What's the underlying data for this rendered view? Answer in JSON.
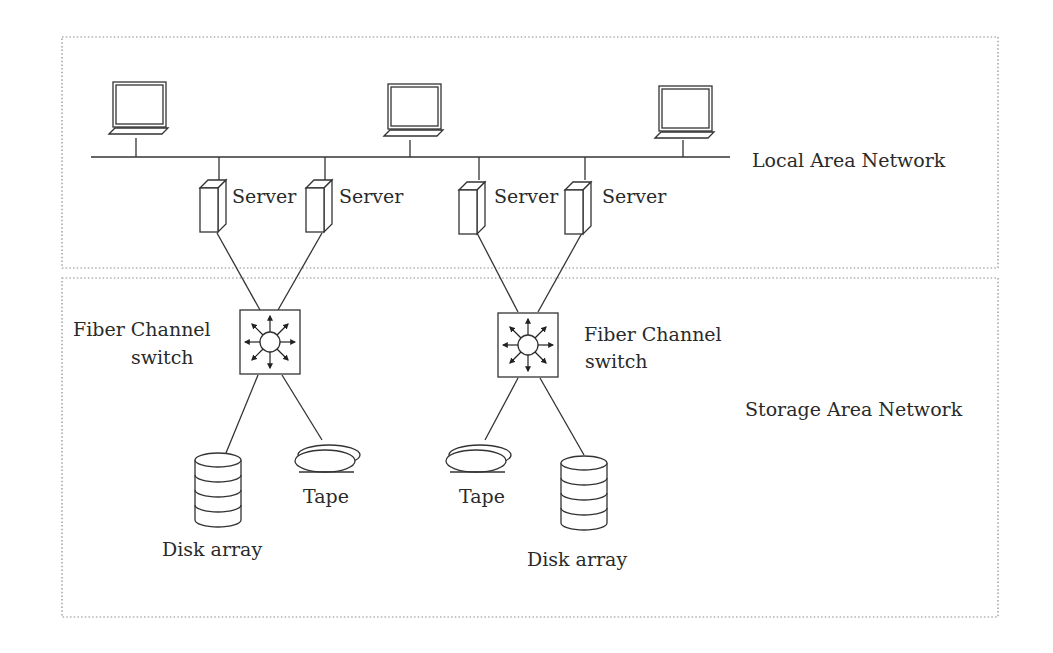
{
  "diagram": {
    "type": "network-architecture",
    "colors": {
      "line": "#333333",
      "border": "#8a8a8a",
      "background": "#ffffff",
      "text": "#2a2a2a"
    },
    "regions": {
      "lan": {
        "label": "Local Area Network"
      },
      "san": {
        "label": "Storage Area Network"
      }
    },
    "nodes": {
      "laptops": [
        {
          "id": "laptop-1"
        },
        {
          "id": "laptop-2"
        },
        {
          "id": "laptop-3"
        }
      ],
      "servers": [
        {
          "id": "server-1",
          "label": "Server"
        },
        {
          "id": "server-2",
          "label": "Server"
        },
        {
          "id": "server-3",
          "label": "Server"
        },
        {
          "id": "server-4",
          "label": "Server"
        }
      ],
      "switches": [
        {
          "id": "switch-1",
          "label_line1": "Fiber Channel",
          "label_line2": "switch"
        },
        {
          "id": "switch-2",
          "label_line1": "Fiber Channel",
          "label_line2": "switch"
        }
      ],
      "disk_arrays": [
        {
          "id": "disk-array-1",
          "label": "Disk array"
        },
        {
          "id": "disk-array-2",
          "label": "Disk array"
        }
      ],
      "tapes": [
        {
          "id": "tape-1",
          "label": "Tape"
        },
        {
          "id": "tape-2",
          "label": "Tape"
        }
      ]
    },
    "edges": [
      [
        "laptop-1",
        "lan-bus"
      ],
      [
        "laptop-2",
        "lan-bus"
      ],
      [
        "laptop-3",
        "lan-bus"
      ],
      [
        "server-1",
        "lan-bus"
      ],
      [
        "server-2",
        "lan-bus"
      ],
      [
        "server-3",
        "lan-bus"
      ],
      [
        "server-4",
        "lan-bus"
      ],
      [
        "server-1",
        "switch-1"
      ],
      [
        "server-2",
        "switch-1"
      ],
      [
        "server-3",
        "switch-2"
      ],
      [
        "server-4",
        "switch-2"
      ],
      [
        "switch-1",
        "disk-array-1"
      ],
      [
        "switch-1",
        "tape-1"
      ],
      [
        "switch-2",
        "tape-2"
      ],
      [
        "switch-2",
        "disk-array-2"
      ]
    ]
  }
}
